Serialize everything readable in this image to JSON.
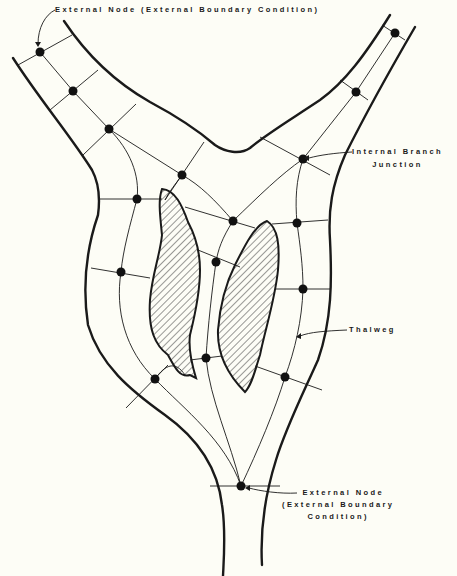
{
  "figure": {
    "colors": {
      "background": "#fdfdf6",
      "ink": "#1a1a1a",
      "hatch": "#333333"
    }
  },
  "labels": {
    "top_external_node": "External Node (External Boundary Condition)",
    "internal_branch_junction_line1": "Internal Branch",
    "internal_branch_junction_line2": "Junction",
    "thalweg": "Thalweg",
    "bottom_external_node_line1": "External Node",
    "bottom_external_node_line2": "(External Boundary",
    "bottom_external_node_line3": "Condition)"
  },
  "nodes": [
    {
      "id": "n1",
      "x": 40,
      "y": 52,
      "role": "external-node"
    },
    {
      "id": "n2",
      "x": 73,
      "y": 91
    },
    {
      "id": "n3",
      "x": 109,
      "y": 129
    },
    {
      "id": "n4",
      "x": 182,
      "y": 175
    },
    {
      "id": "n5",
      "x": 137,
      "y": 199
    },
    {
      "id": "n6",
      "x": 233,
      "y": 221
    },
    {
      "id": "n7",
      "x": 303,
      "y": 159,
      "role": "internal-branch-junction"
    },
    {
      "id": "n8",
      "x": 356,
      "y": 92
    },
    {
      "id": "n9",
      "x": 395,
      "y": 33,
      "role": "external-node"
    },
    {
      "id": "n10",
      "x": 297,
      "y": 223
    },
    {
      "id": "n11",
      "x": 121,
      "y": 272
    },
    {
      "id": "n12",
      "x": 216,
      "y": 262
    },
    {
      "id": "n13",
      "x": 303,
      "y": 289
    },
    {
      "id": "n14",
      "x": 155,
      "y": 379
    },
    {
      "id": "n15",
      "x": 206,
      "y": 358
    },
    {
      "id": "n16",
      "x": 285,
      "y": 377
    },
    {
      "id": "n17",
      "x": 241,
      "y": 486,
      "role": "external-node"
    }
  ],
  "islands": [
    {
      "name": "left-island"
    },
    {
      "name": "right-island"
    }
  ]
}
